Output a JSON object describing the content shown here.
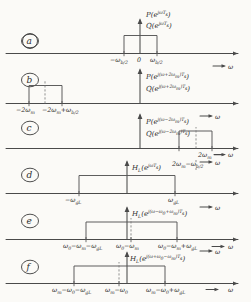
{
  "figure": {
    "axis_symbol": "ω",
    "panels": [
      {
        "id": "a",
        "letter": "a",
        "function_lines": [
          "P(e",
          "jωT",
          "s",
          ")",
          "Q(e",
          "jωT",
          "s",
          ")"
        ],
        "fn_num": "P(e",
        "fn_num_exp": "jωT",
        "fn_num_exp_sub": "s",
        "fn_den": "Q(e",
        "tick_labels": [
          "−ω",
          "b/2",
          "0",
          "ω",
          "b/2"
        ],
        "labels": [
          {
            "main": "−ω",
            "sub": "b/2"
          },
          {
            "main": "0",
            "sub": ""
          },
          {
            "main": "ω",
            "sub": "b/2"
          }
        ]
      },
      {
        "id": "b",
        "letter": "b",
        "fn_num": "P(e",
        "fn_num_exp": "j(ω+2ω",
        "fn_num_exp_sub": "m",
        "fn_num_exp_tail": ")T",
        "fn_num_exp_tail_sub": "s",
        "fn_den": "Q(e",
        "labels": [
          {
            "main": "−2ω",
            "sub": "m"
          },
          {
            "main": "−2ω",
            "sub": "m",
            "tail": "+ω",
            "tailsub": "b/2"
          }
        ]
      },
      {
        "id": "c",
        "letter": "c",
        "fn_num": "P(e",
        "fn_num_exp": "j(ω−2ω",
        "fn_num_exp_sub": "m",
        "fn_num_exp_tail": ")T",
        "fn_num_exp_tail_sub": "s",
        "fn_den": "Q(e",
        "labels": [
          {
            "main": "2ω",
            "sub": "m",
            "tail": "−ω",
            "tailsub": "b/2"
          },
          {
            "main": "2ω",
            "sub": "m"
          }
        ]
      },
      {
        "id": "d",
        "letter": "d",
        "fn": "H",
        "fn_sub": "L",
        "fn_rest": "(e",
        "fn_exp": "jωT",
        "fn_exp_sub": "s",
        "fn_close": ")",
        "labels": [
          {
            "main": "−ω",
            "sub": "gL"
          },
          {
            "main": "ω",
            "sub": "gL"
          }
        ]
      },
      {
        "id": "e",
        "letter": "e",
        "fn": "H",
        "fn_sub": "L",
        "fn_rest": "(e",
        "fn_exp": "j(ω−ω",
        "fn_exp_sub": "0",
        "fn_exp_tail": "+ω",
        "fn_exp_tail_sub": "m",
        "fn_exp_end": ")T",
        "fn_exp_end_sub": "s",
        "fn_close": ")",
        "labels": [
          {
            "main": "ω",
            "sub": "0",
            "tail": "−ω",
            "tailsub": "m",
            "tail2": "−ω",
            "tail2sub": "gL"
          },
          {
            "main": "ω",
            "sub": "0",
            "tail": "−ω",
            "tailsub": "m"
          },
          {
            "main": "ω",
            "sub": "0",
            "tail": "−ω",
            "tailsub": "m",
            "tail2": "+ω",
            "tail2sub": "gL"
          }
        ]
      },
      {
        "id": "f",
        "letter": "f",
        "fn": "H",
        "fn_sub": "L",
        "fn_rest": "(e",
        "fn_exp": "j(ω+ω",
        "fn_exp_sub": "0",
        "fn_exp_tail": "−ω",
        "fn_exp_tail_sub": "m",
        "fn_exp_end": ")T",
        "fn_exp_end_sub": "s",
        "fn_close": ")",
        "labels": [
          {
            "main": "ω",
            "sub": "m",
            "tail": "−ω",
            "tailsub": "0",
            "tail2": "−ω",
            "tail2sub": "gL"
          },
          {
            "main": "ω",
            "sub": "m",
            "tail": "−ω",
            "tailsub": "0"
          },
          {
            "main": "ω",
            "sub": "m",
            "tail": "−ω",
            "tailsub": "0",
            "tail2": "+ω",
            "tail2sub": "gL"
          }
        ]
      }
    ]
  },
  "text": {
    "omega": "ω",
    "minus": "−",
    "a": "a",
    "b": "b",
    "c": "c",
    "d": "d",
    "e": "e",
    "f": "f",
    "zero": "0",
    "P_open": "P(e",
    "Q_open": "Q(e",
    "H_L": "H",
    "L_sub": "L",
    "paren_close": ")",
    "exp_jwTs": "jωT",
    "s_sub": "s",
    "exp_b": "j(ω+2ω",
    "exp_c": "j(ω−2ω",
    "exp_e": "j(ω−ω",
    "exp_f": "j(ω+ω",
    "m_sub": "m",
    "zero_sub": "0",
    "gL_sub": "gL",
    "b2_sub": "b/2",
    "close_Ts": ")T",
    "plus_w": "+ω",
    "minus_w": "−ω",
    "two_wm": "2ω",
    "neg_two_wm": "−2ω",
    "open_e": "(e"
  }
}
